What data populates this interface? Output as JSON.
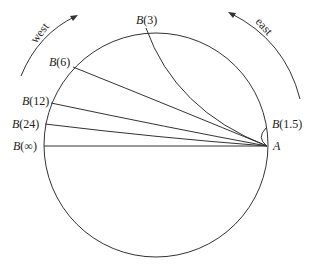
{
  "diagram": {
    "type": "circle-geodesics",
    "point_A": {
      "label": "A",
      "x": 267,
      "y": 146
    },
    "circle": {
      "cx": 156,
      "cy": 145,
      "r": 112,
      "stroke": "#333333"
    },
    "direction_labels": {
      "west": "west",
      "east": "east"
    },
    "points": [
      {
        "id": "B3",
        "label_prefix": "B",
        "label_arg": "(3)",
        "x": 146,
        "y": 28
      },
      {
        "id": "B6",
        "label_prefix": "B",
        "label_arg": "(6)",
        "x": 73,
        "y": 67
      },
      {
        "id": "B12",
        "label_prefix": "B",
        "label_arg": "(12)",
        "x": 51,
        "y": 103
      },
      {
        "id": "B24",
        "label_prefix": "B",
        "label_arg": "(24)",
        "x": 45,
        "y": 124
      },
      {
        "id": "Binf",
        "label_prefix": "B",
        "label_arg": "(∞)",
        "x": 44,
        "y": 146
      },
      {
        "id": "B1_5",
        "label_prefix": "B",
        "label_arg": "(1.5)",
        "x": 266,
        "y": 128
      }
    ]
  }
}
